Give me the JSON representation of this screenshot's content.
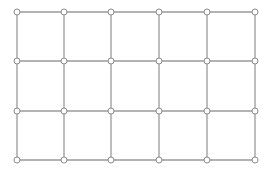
{
  "diagram": {
    "type": "grid-graph",
    "rows": 4,
    "cols": 6,
    "x": [
      17,
      64,
      111,
      159,
      207,
      255
    ],
    "y": [
      12,
      61,
      111,
      160
    ],
    "node_radius": 3,
    "colors": {
      "edge": "#9a9a9a",
      "node_stroke": "#8a8a8a",
      "node_fill": "#ffffff",
      "background": "#ffffff"
    }
  }
}
